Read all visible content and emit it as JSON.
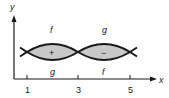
{
  "diagram": {
    "axes": {
      "x_label": "x",
      "y_label": "y"
    },
    "x_ticks": [
      {
        "value": "1",
        "x": 27
      },
      {
        "value": "3",
        "x": 78
      },
      {
        "value": "5",
        "x": 130
      }
    ],
    "regions": [
      {
        "sign": "+",
        "top_curve": "f",
        "bottom_curve": "g",
        "from": "1",
        "to": "3"
      },
      {
        "sign": "−",
        "top_curve": "g",
        "bottom_curve": "f",
        "from": "3",
        "to": "5"
      }
    ],
    "colors": {
      "stroke": "#1a1a1a",
      "fill": "#c8c8c8",
      "background": "#ffffff"
    }
  }
}
